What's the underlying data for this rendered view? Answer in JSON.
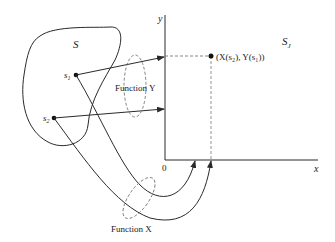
{
  "diagram": {
    "set_label": "S",
    "target_label_main": "S",
    "target_label_sub": "J",
    "axis_x_label": "x",
    "axis_y_label": "y",
    "origin_label": "0",
    "point1_label_main": "s",
    "point1_label_sub": "1",
    "point2_label_main": "s",
    "point2_label_sub": "2",
    "function_y_label": "Function Y",
    "function_x_label": "Function X",
    "mapped_point_label": "(X(s₂), Y(s₁))",
    "colors": {
      "line": "#2a2a2a",
      "dashed": "#777777"
    }
  }
}
